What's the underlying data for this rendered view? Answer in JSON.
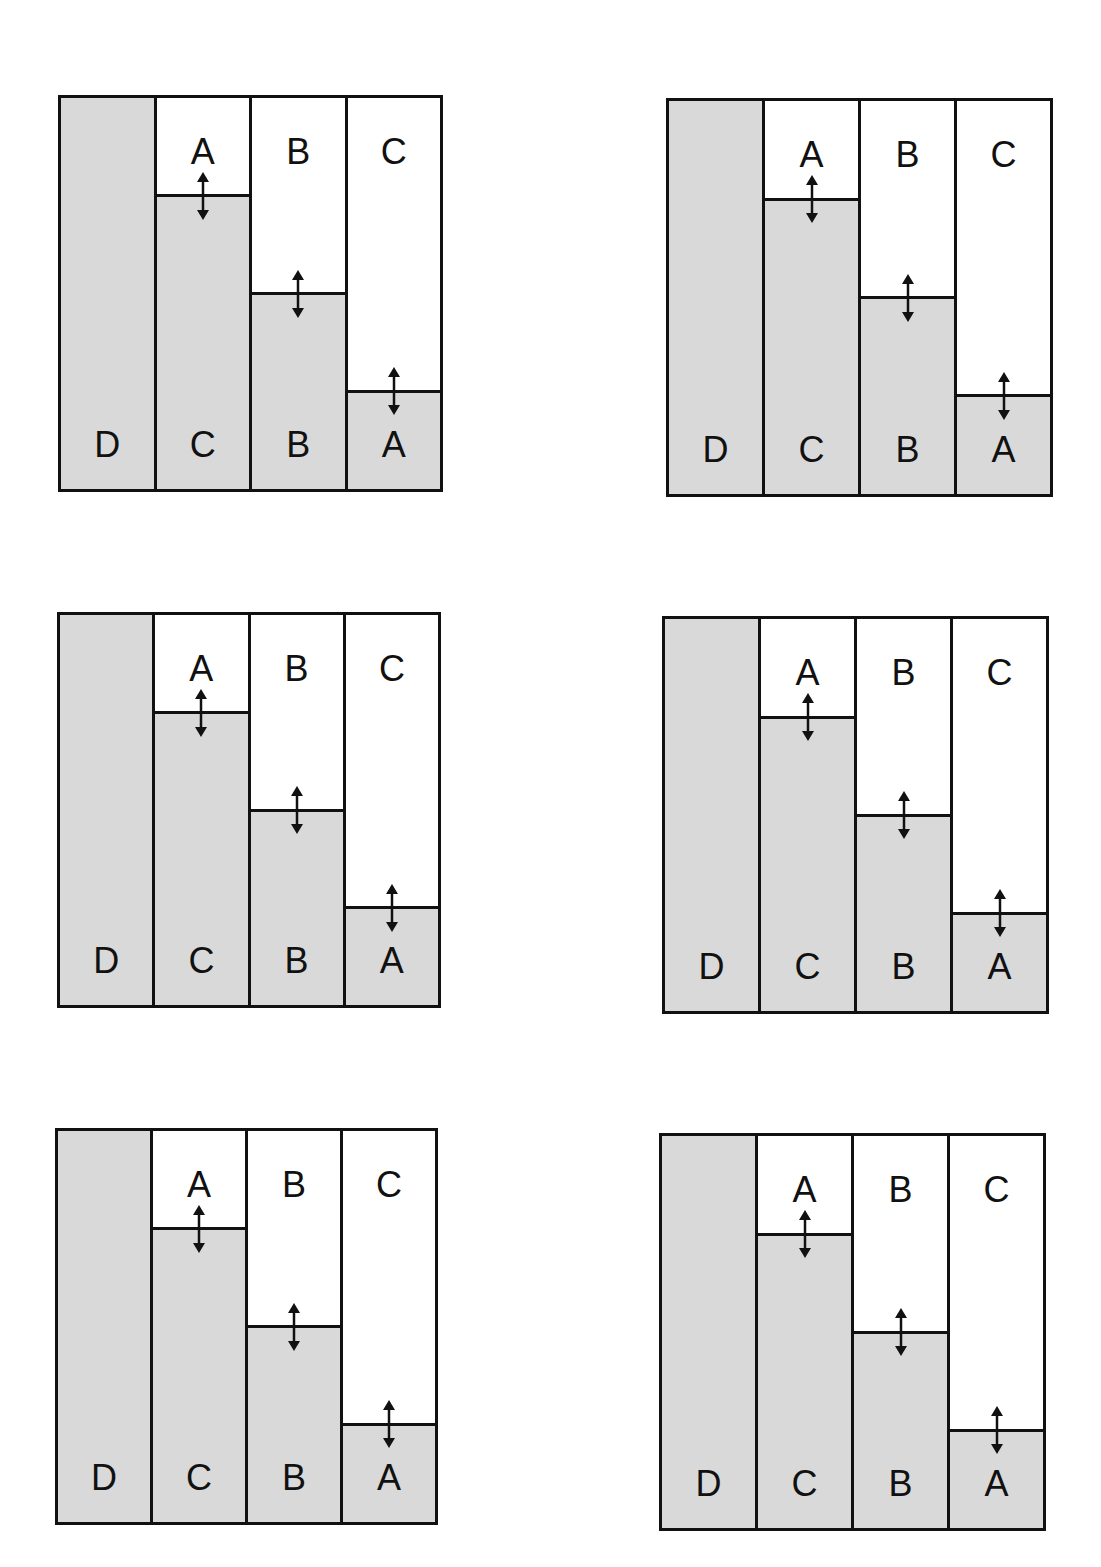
{
  "diagram": {
    "colors": {
      "fill": "#d9d9d9",
      "empty": "#ffffff",
      "line": "#111111"
    },
    "panels": [
      {
        "id": "panel-1",
        "x": 58,
        "y": 95,
        "w": 385,
        "h": 397
      },
      {
        "id": "panel-2",
        "x": 666,
        "y": 98,
        "w": 387,
        "h": 399
      },
      {
        "id": "panel-3",
        "x": 57,
        "y": 612,
        "w": 384,
        "h": 396
      },
      {
        "id": "panel-4",
        "x": 662,
        "y": 616,
        "w": 387,
        "h": 398
      },
      {
        "id": "panel-5",
        "x": 55,
        "y": 1128,
        "w": 383,
        "h": 397
      },
      {
        "id": "panel-6",
        "x": 659,
        "y": 1133,
        "w": 387,
        "h": 398
      }
    ],
    "columns": [
      {
        "top_label": "",
        "bottom_label": "D",
        "fill_fraction": 1.0,
        "arrow": false
      },
      {
        "top_label": "A",
        "bottom_label": "C",
        "fill_fraction": 0.75,
        "arrow": true
      },
      {
        "top_label": "B",
        "bottom_label": "B",
        "fill_fraction": 0.5,
        "arrow": true
      },
      {
        "top_label": "C",
        "bottom_label": "A",
        "fill_fraction": 0.25,
        "arrow": true
      }
    ],
    "arrow_icon": "double-headed-vertical-arrow"
  }
}
